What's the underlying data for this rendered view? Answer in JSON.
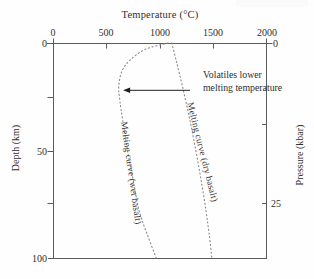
{
  "figure": {
    "title": "Temperature (°C)",
    "axes": {
      "top": {
        "label": "Temperature (°C)",
        "ticks": [
          "0",
          "500",
          "1000",
          "1500",
          "2000"
        ]
      },
      "left": {
        "label": "Depth (km)",
        "ticks": [
          "0",
          "50",
          "100"
        ]
      },
      "right": {
        "label": "Pressure (kbar)",
        "ticks": [
          "0",
          "25"
        ]
      }
    },
    "annotation": {
      "line1": "Volatiles lower",
      "line2": "melting temperature"
    },
    "curves": {
      "wet": {
        "label": "Melting curve (wet basalt)"
      },
      "dry": {
        "label": "Melting curve (dry basalt)"
      }
    },
    "colors": {
      "axis": "#5a5a5a",
      "curve": "#8a8a8a",
      "arrow": "#1f1f1f",
      "text": "#2f2f2f"
    }
  },
  "chart_data": {
    "type": "line",
    "title": "",
    "xlabel": "Temperature (°C)",
    "ylabel_left": "Depth (km)",
    "ylabel_right": "Pressure (kbar)",
    "xlim": [
      0,
      2000
    ],
    "ylim_depth_km": [
      0,
      100
    ],
    "ylim_pressure_kbar": [
      0,
      33.3
    ],
    "x_ticks": [
      0,
      500,
      1000,
      1500,
      2000
    ],
    "left_ticks_depth_km": [
      0,
      50,
      100
    ],
    "right_ticks_pressure_kbar": [
      0,
      25
    ],
    "grid": false,
    "line_style": "dotted",
    "series": [
      {
        "name": "Melting curve (wet basalt)",
        "depth_km": [
          0,
          3,
          8,
          13,
          20,
          27,
          37,
          51,
          64,
          78,
          89,
          100
        ],
        "temperature_C": [
          1075,
          860,
          720,
          645,
          615,
          625,
          655,
          700,
          750,
          805,
          880,
          965
        ]
      },
      {
        "name": "Melting curve (dry basalt)",
        "depth_km": [
          0,
          8,
          17,
          27,
          36,
          50,
          64,
          78,
          89,
          100
        ],
        "temperature_C": [
          1110,
          1150,
          1195,
          1240,
          1280,
          1335,
          1385,
          1430,
          1460,
          1485
        ]
      }
    ],
    "annotation": {
      "text": "Volatiles lower melting temperature",
      "arrow": {
        "from": {
          "temperature_C": 1280,
          "depth_km": 22
        },
        "to": {
          "temperature_C": 655,
          "depth_km": 22
        },
        "direction": "left"
      }
    }
  }
}
